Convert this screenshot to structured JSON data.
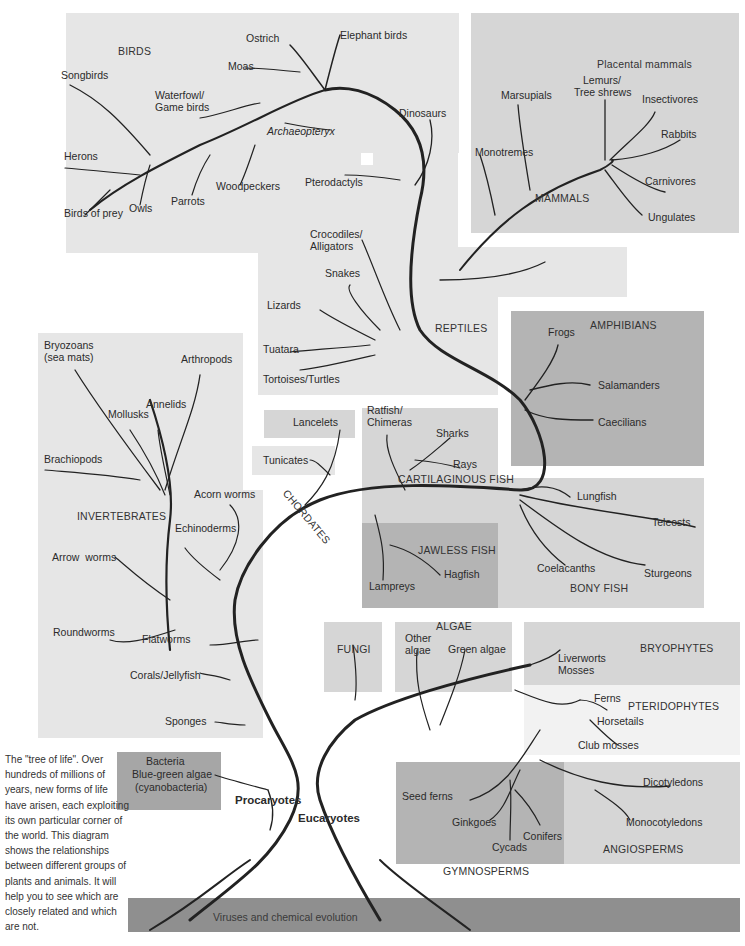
{
  "caption": "The \"tree of life\". Over hundreds of millions of years, new forms of life have arisen, each exploiting its own particular corner of the world. This diagram shows the relationships between different groups of plants and animals. It will help you to see which are closely related and which are not.",
  "groups": {
    "birds": "BIRDS",
    "mammals": "MAMMALS",
    "placental_mammals": "Placental mammals",
    "reptiles": "REPTILES",
    "amphibians": "AMPHIBIANS",
    "invertebrates": "INVERTEBRATES",
    "chordates": "CHORDATES",
    "cartilaginous_fish": "CARTILAGINOUS FISH",
    "jawless_fish": "JAWLESS FISH",
    "bony_fish": "BONY FISH",
    "fungi": "FUNGI",
    "algae": "ALGAE",
    "bryophytes": "BRYOPHYTES",
    "pteridophytes": "PTERIDOPHYTES",
    "gymnosperms": "GYMNOSPERMS",
    "angiosperms": "ANGIOSPERMS",
    "procaryotes": "Procaryotes",
    "eucaryotes": "Eucaryotes",
    "base": "Viruses and chemical evolution"
  },
  "birds": [
    "Ostrich",
    "Elephant birds",
    "Moas",
    "Songbirds",
    "Waterfowl/",
    "Game birds",
    "Archaeopteryx",
    "Herons",
    "Woodpeckers",
    "Parrots",
    "Owls",
    "Birds of prey"
  ],
  "mammals": [
    "Marsupials",
    "Lemurs/",
    "Tree shrews",
    "Insectivores",
    "Rabbits",
    "Monotremes",
    "Carnivores",
    "Ungulates"
  ],
  "reptiles": [
    "Dinosaurs",
    "Pterodactyls",
    "Crocodiles/",
    "Alligators",
    "Snakes",
    "Lizards",
    "Tuatara",
    "Tortoises/Turtles"
  ],
  "amphibians": [
    "Frogs",
    "Salamanders",
    "Caecilians"
  ],
  "invertebrates": [
    "Bryozoans",
    "(sea mats)",
    "Arthropods",
    "Annelids",
    "Mollusks",
    "Brachiopods",
    "Acorn worms",
    "Echinoderms",
    "Arrow  worms",
    "Roundworms",
    "Flatworms",
    "Corals/Jellyfish",
    "Sponges"
  ],
  "chordates": [
    "Lancelets",
    "Tunicates"
  ],
  "cartilaginous_fish": [
    "Ratfish/",
    "Chimeras",
    "Sharks",
    "Rays"
  ],
  "jawless_fish": [
    "Lampreys",
    "Hagfish"
  ],
  "bony_fish": [
    "Lungfish",
    "Teleosts",
    "Coelacanths",
    "Sturgeons"
  ],
  "algae": [
    "Other",
    "algae",
    "Green algae"
  ],
  "bryophytes": [
    "Liverworts",
    "Mosses"
  ],
  "pteridophytes": [
    "Ferns",
    "Horsetails",
    "Club mosses"
  ],
  "gymnosperms": [
    "Seed ferns",
    "Ginkgoes",
    "Cycads",
    "Conifers"
  ],
  "angiosperms": [
    "Dicotyledons",
    "Monocotyledons"
  ],
  "procaryotes": [
    "Bacteria",
    "Blue-green algae",
    "(cyanobacteria)"
  ]
}
